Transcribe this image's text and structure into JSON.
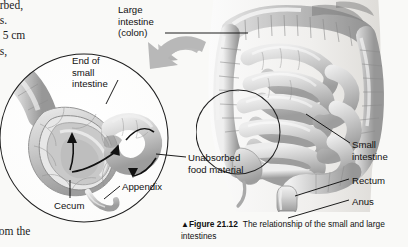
{
  "figure": {
    "background_color": "#f9f9f7",
    "ink_color": "#111111",
    "arrow_color": "#b9b9b9",
    "organ_fill": "#cfcfcf",
    "organ_shade": "#9a9a9a"
  },
  "body_text": {
    "top_fragment": "orbed,\nns.\nd 5 cm\nvs,",
    "bottom_fragment": "rom the"
  },
  "labels": {
    "large_intestine": "Large\nintestine\n(colon)",
    "end_of_small_intestine": "End of\nsmall\nintestine",
    "unabsorbed_food_material": "Unabsorbed\nfood material",
    "appendix": "Appendix",
    "cecum": "Cecum",
    "small_intestine": "Small\nintestine",
    "rectum": "Rectum",
    "anus": "Anus"
  },
  "caption": {
    "marker": "▲",
    "figure_number": "Figure 21.12",
    "text": "The relationship of the small and large intestines"
  },
  "icons": {
    "callout_arrow": "curved-block-arrow-icon",
    "flow_arrows": "flow-direction-arrow-icon"
  }
}
